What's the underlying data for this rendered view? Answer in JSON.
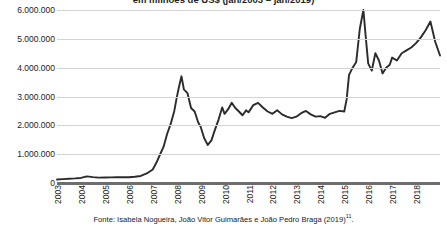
{
  "figure": {
    "caption": "Fonte: Isabela Nogueira, João Vitor Guimarães e João Pedro Braga (2019)",
    "caption_footnote": "11",
    "caption_end": "."
  },
  "chart_data": {
    "type": "line",
    "title": "em milhões de US$ (jan/2003 – jan/2019)",
    "xlabel": "",
    "ylabel": "",
    "grid": true,
    "legend": "none",
    "line_color": "#2b2b2b",
    "xlim": [
      2003.0,
      2019.0
    ],
    "ylim": [
      0,
      6000000
    ],
    "yticks": [
      0,
      1000000,
      2000000,
      3000000,
      4000000,
      5000000,
      6000000
    ],
    "ytick_labels": [
      "0",
      "1.000.000",
      "2.000.000",
      "3.000.000",
      "4.000.000",
      "5.000.000",
      "6.000.000"
    ],
    "categories": [
      "2003",
      "2004",
      "2005",
      "2006",
      "2007",
      "2008",
      "2009",
      "2010",
      "2011",
      "2012",
      "2013",
      "2014",
      "2015",
      "2016",
      "2017",
      "2018"
    ],
    "xtick_values": [
      2003,
      2004,
      2005,
      2006,
      2007,
      2008,
      2009,
      2010,
      2011,
      2012,
      2013,
      2014,
      2015,
      2016,
      2017,
      2018
    ],
    "series": [
      {
        "name": "Estoque de investimento chinês (milhões de US$)",
        "x": [
          2003.0,
          2003.25,
          2003.5,
          2003.75,
          2004.0,
          2004.25,
          2004.5,
          2004.75,
          2005.0,
          2005.25,
          2005.5,
          2005.75,
          2006.0,
          2006.25,
          2006.5,
          2006.75,
          2007.0,
          2007.15,
          2007.3,
          2007.45,
          2007.6,
          2007.75,
          2007.9,
          2008.0,
          2008.1,
          2008.2,
          2008.3,
          2008.45,
          2008.6,
          2008.75,
          2008.9,
          2009.0,
          2009.15,
          2009.3,
          2009.45,
          2009.6,
          2009.75,
          2009.9,
          2010.0,
          2010.15,
          2010.3,
          2010.45,
          2010.6,
          2010.75,
          2010.9,
          2011.0,
          2011.2,
          2011.4,
          2011.6,
          2011.8,
          2012.0,
          2012.2,
          2012.4,
          2012.6,
          2012.8,
          2013.0,
          2013.2,
          2013.4,
          2013.6,
          2013.8,
          2014.0,
          2014.2,
          2014.4,
          2014.6,
          2014.8,
          2015.0,
          2015.1,
          2015.2,
          2015.35,
          2015.5,
          2015.65,
          2015.8,
          2015.9,
          2016.0,
          2016.15,
          2016.3,
          2016.45,
          2016.6,
          2016.75,
          2016.9,
          2017.0,
          2017.2,
          2017.4,
          2017.6,
          2017.8,
          2018.0,
          2018.2,
          2018.4,
          2018.6,
          2018.8,
          2019.0
        ],
        "values": [
          120000,
          135000,
          150000,
          160000,
          175000,
          230000,
          205000,
          185000,
          190000,
          195000,
          200000,
          205000,
          200000,
          215000,
          245000,
          330000,
          470000,
          700000,
          980000,
          1250000,
          1700000,
          2050000,
          2500000,
          2950000,
          3350000,
          3700000,
          3250000,
          3120000,
          2600000,
          2480000,
          2100000,
          1950000,
          1550000,
          1320000,
          1480000,
          1850000,
          2200000,
          2620000,
          2400000,
          2560000,
          2780000,
          2600000,
          2480000,
          2350000,
          2520000,
          2450000,
          2700000,
          2780000,
          2620000,
          2480000,
          2400000,
          2520000,
          2380000,
          2300000,
          2250000,
          2300000,
          2420000,
          2500000,
          2380000,
          2300000,
          2320000,
          2260000,
          2400000,
          2450000,
          2500000,
          2480000,
          2900000,
          3750000,
          4000000,
          4200000,
          5350000,
          6000000,
          5050000,
          4150000,
          3900000,
          4500000,
          4250000,
          3800000,
          4000000,
          4100000,
          4350000,
          4250000,
          4500000,
          4600000,
          4700000,
          4850000,
          5050000,
          5300000,
          5600000,
          4900000,
          4420000
        ]
      }
    ]
  }
}
